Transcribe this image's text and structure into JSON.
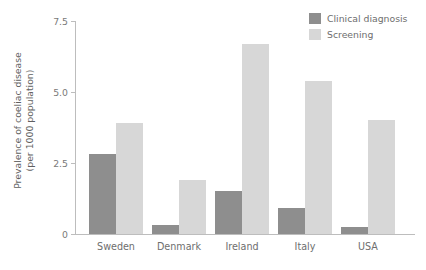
{
  "chart_data": {
    "type": "bar",
    "title": "",
    "subtitle": "",
    "xlabel": "",
    "ylabel_line1": "Prevalence of coeliac disease",
    "ylabel_line2": "(per 1000 population)",
    "categories": [
      "Sweden",
      "Denmark",
      "Ireland",
      "Italy",
      "USA"
    ],
    "series": [
      {
        "name": "Clinical diagnosis",
        "color": "#8e8e8e",
        "values": [
          2.8,
          0.3,
          1.5,
          0.9,
          0.25
        ]
      },
      {
        "name": "Screening",
        "color": "#d7d7d7",
        "values": [
          3.9,
          1.9,
          6.7,
          5.4,
          4.0
        ]
      }
    ],
    "ylim": [
      0,
      7.5
    ],
    "yticks": [
      0,
      2.5,
      5.0,
      7.5
    ],
    "ytick_labels": [
      "0",
      "2.5",
      "5.0",
      "7.5"
    ],
    "grid": false,
    "legend_position": "top-right"
  },
  "legend": {
    "items": [
      {
        "label": "Clinical diagnosis",
        "swatch": "clinical"
      },
      {
        "label": "Screening",
        "swatch": "screening"
      }
    ]
  },
  "colors": {
    "clinical": "#8e8e8e",
    "screening": "#d7d7d7",
    "axis": "#bdbdbd",
    "text": "#6e6e6e",
    "background": "#ffffff"
  }
}
